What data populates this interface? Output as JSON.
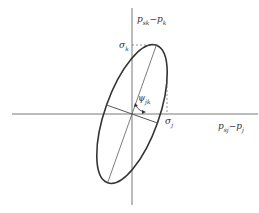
{
  "diagram": {
    "type": "tilted-ellipse-stress-plot",
    "axes": {
      "x_label": "pₑⱼ−pⱼ",
      "x_label_main": "p",
      "x_label_sub": "sj",
      "x_label_rest": "−p",
      "x_label_sub2": "j",
      "y_label_main": "p",
      "y_label_sub": "sk",
      "y_label_rest": "−p",
      "y_label_sub2": "k"
    },
    "markers": {
      "sigma_k": {
        "main": "σ",
        "sub": "k"
      },
      "sigma_j": {
        "main": "σ",
        "sub": "j"
      },
      "angle": {
        "main": "ψ",
        "sub": "jk"
      }
    },
    "colors": {
      "line": "#333333",
      "background": "#ffffff"
    }
  }
}
